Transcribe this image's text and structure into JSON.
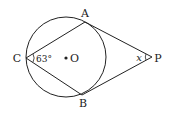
{
  "diagram": {
    "labels": {
      "A": "A",
      "B": "B",
      "C": "C",
      "O": "O",
      "P": "P",
      "x": "x"
    },
    "angle_C": "63°",
    "colors": {
      "stroke": "#222222",
      "background": "#ffffff"
    }
  }
}
